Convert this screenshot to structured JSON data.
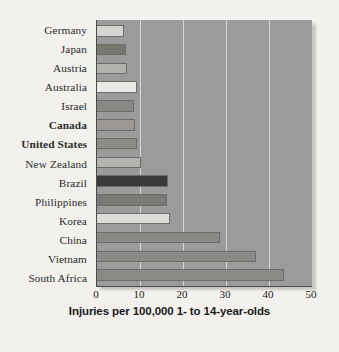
{
  "chart_data": {
    "type": "bar",
    "orientation": "horizontal",
    "title": "",
    "subtitle": "",
    "xlabel": "Injuries per 100,000 1- to 14-year-olds",
    "ylabel": "",
    "xlim": [
      0,
      50
    ],
    "xticks": [
      0,
      10,
      20,
      30,
      40,
      50
    ],
    "grid": "vertical",
    "legend": "none",
    "categories": [
      "Germany",
      "Japan",
      "Austria",
      "Australia",
      "Israel",
      "Canada",
      "United States",
      "New Zealand",
      "Brazil",
      "Philippines",
      "Korea",
      "China",
      "Vietnam",
      "South Africa"
    ],
    "values": [
      6.3,
      6.8,
      7.0,
      9.2,
      8.6,
      8.8,
      9.4,
      10.2,
      16.5,
      16.3,
      17.0,
      28.5,
      37.0,
      43.5
    ],
    "bar_colors": [
      "#d6d5d2",
      "#77766f",
      "#b4b2ad",
      "#eceae6",
      "#8a8884",
      "#9b9894",
      "#8e8c87",
      "#b5b3ae",
      "#3b3a38",
      "#7b7975",
      "#dedcd8",
      "#8b8985",
      "#8b8985",
      "#8b8985"
    ],
    "bold_categories": [
      "Canada",
      "United States"
    ],
    "plot_background": "#9b9b9b",
    "gridline_color": "#d8d6d2",
    "axis_color": "#4a4a4a",
    "page_background": "#f2f1ee"
  },
  "caption_fragment": ""
}
